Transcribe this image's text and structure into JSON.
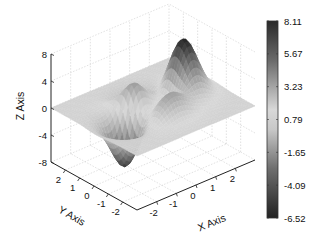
{
  "chart_data": {
    "type": "surface3d",
    "title": "",
    "xlabel": "X Axis",
    "ylabel": "Y Axis",
    "zlabel": "Z Axis",
    "x_ticks": [
      "-2",
      "-1",
      "0",
      "1",
      "2"
    ],
    "y_ticks": [
      "2",
      "1",
      "0",
      "-1",
      "-2"
    ],
    "z_ticks": [
      "8",
      "4",
      "0",
      "-4",
      "-8"
    ],
    "xlim": [
      -3,
      3
    ],
    "ylim": [
      -3,
      3
    ],
    "zlim": [
      -8,
      8
    ],
    "grid": true,
    "colormap": "gray",
    "colorbar": {
      "position": "right",
      "ticks": [
        "8.11",
        "5.67",
        "3.23",
        "0.79",
        "-1.65",
        "-4.09",
        "-6.52"
      ],
      "min": -6.52,
      "max": 8.11
    },
    "surface_function": "peaks(x,y)",
    "features": [
      {
        "kind": "peak",
        "x": 0,
        "y": 1.58,
        "z": 8.11
      },
      {
        "kind": "trough",
        "x": 0.23,
        "y": -1.63,
        "z": -6.55
      },
      {
        "kind": "local_min",
        "x": -1.35,
        "y": 0.2,
        "z": -3.05
      },
      {
        "kind": "local_max",
        "x": 1.3,
        "y": 0.0,
        "z": 3.78
      }
    ]
  }
}
